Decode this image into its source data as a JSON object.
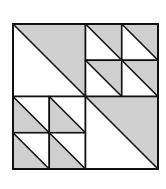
{
  "figure": {
    "colors": {
      "background": "#ffffff",
      "shaded": "#cfcfcf",
      "unshaded": "#ffffff",
      "stroke": "#111111"
    },
    "bounds": {
      "x": 13,
      "y": 24,
      "size": 145
    },
    "stroke_width": 1.6,
    "quadrants": [
      {
        "name": "top-left",
        "col": 0,
        "row": 0,
        "subdivisions": 1,
        "diagonal": "tl-br",
        "shaded_half": "upper-right"
      },
      {
        "name": "top-right",
        "col": 1,
        "row": 0,
        "subdivisions": 2,
        "diagonal": "tl-br",
        "shaded_half": "upper-right"
      },
      {
        "name": "bottom-left",
        "col": 0,
        "row": 1,
        "subdivisions": 2,
        "diagonal": "tl-br",
        "shaded_half": "lower-left"
      },
      {
        "name": "bottom-right",
        "col": 1,
        "row": 1,
        "subdivisions": 1,
        "diagonal": "tl-br",
        "shaded_half": "upper-right"
      }
    ]
  }
}
